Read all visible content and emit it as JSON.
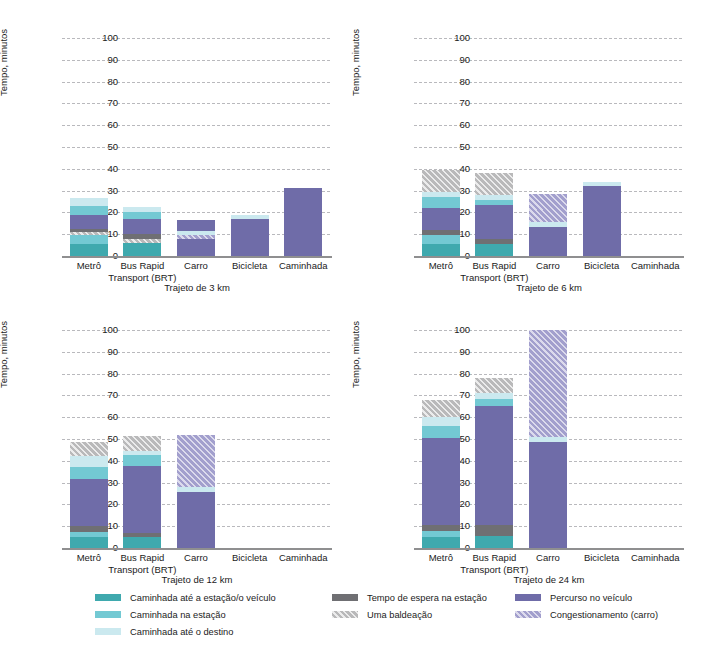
{
  "figure": {
    "ylabel": "Tempo, minutos",
    "yticks": [
      0,
      10,
      20,
      30,
      40,
      50,
      60,
      70,
      80,
      90,
      100
    ],
    "categories": [
      "Metrô",
      "Bus Rapid Transport (BRT)",
      "Carro",
      "Bicicleta",
      "Caminhada"
    ]
  },
  "legend": {
    "columns": [
      {
        "items": [
          {
            "label": "Caminhada até a estação/o veículo",
            "color": "#3fa9ae",
            "key": "walk_station"
          },
          {
            "label": "Caminhada na estação",
            "color": "#73c9d3",
            "key": "walk_in_station"
          },
          {
            "label": "Caminhada até o destino",
            "color": "#cbe9ef",
            "key": "walk_dest"
          }
        ]
      },
      {
        "items": [
          {
            "label": "Tempo de espera na estação",
            "color": "#6f6f73",
            "key": "wait"
          },
          {
            "label": "Uma baldeação",
            "color": "#b9b9ba",
            "key": "transfer"
          }
        ]
      },
      {
        "items": [
          {
            "label": "Percurso no veículo",
            "color": "#6f6ca8",
            "key": "vehicle"
          },
          {
            "label": "Congestionamento (carro)",
            "color": "#a29fcd",
            "key": "congestion"
          }
        ]
      }
    ]
  },
  "chart_data": {
    "type": "bar",
    "stacked": true,
    "title": "",
    "xlabel": "",
    "ylabel": "Tempo, minutos",
    "ylim": [
      0,
      100
    ],
    "yticks": [
      0,
      10,
      20,
      30,
      40,
      50,
      60,
      70,
      80,
      90,
      100
    ],
    "grid": true,
    "legend_position": "bottom",
    "categories": [
      "Metrô",
      "Bus Rapid Transport (BRT)",
      "Carro",
      "Bicicleta",
      "Caminhada"
    ],
    "series": [
      {
        "name": "Caminhada até a estação/o veículo",
        "key": "walk_station",
        "color": "#3fa9ae"
      },
      {
        "name": "Caminhada na estação",
        "key": "walk_in_station",
        "color": "#73c9d3"
      },
      {
        "name": "Tempo de espera na estação",
        "key": "wait",
        "color": "#6f6f73"
      },
      {
        "name": "Percurso no veículo",
        "key": "vehicle",
        "color": "#6f6ca8"
      },
      {
        "name": "Congestionamento (carro)",
        "key": "congestion",
        "color": "#a29fcd"
      },
      {
        "name": "Caminhada até o destino",
        "key": "walk_dest",
        "color": "#cbe9ef"
      },
      {
        "name": "Uma baldeação",
        "key": "transfer",
        "color": "#b9b9ba"
      }
    ],
    "panels": [
      {
        "label": "Trajeto de 3 km",
        "bars": [
          {
            "category": "Metrô",
            "total": 26.5,
            "segments": [
              {
                "key": "walk_station",
                "value": 5.5
              },
              {
                "key": "walk_in_station",
                "value": 4.0
              },
              {
                "key": "transfer",
                "value": 1.5
              },
              {
                "key": "wait",
                "value": 1.5
              },
              {
                "key": "vehicle",
                "value": 6.5
              },
              {
                "key": "walk_in_station",
                "value": 4.0
              },
              {
                "key": "walk_dest",
                "value": 3.5
              }
            ]
          },
          {
            "category": "Bus Rapid Transport (BRT)",
            "total": 22.5,
            "segments": [
              {
                "key": "walk_station",
                "value": 6.0
              },
              {
                "key": "transfer",
                "value": 2.0
              },
              {
                "key": "wait",
                "value": 2.0
              },
              {
                "key": "vehicle",
                "value": 7.0
              },
              {
                "key": "walk_in_station",
                "value": 3.0
              },
              {
                "key": "walk_dest",
                "value": 2.5
              }
            ]
          },
          {
            "category": "Carro",
            "total": 16.5,
            "segments": [
              {
                "key": "vehicle",
                "value": 8.0
              },
              {
                "key": "congestion",
                "value": 1.5
              },
              {
                "key": "walk_dest",
                "value": 2.0
              },
              {
                "key": "vehicle",
                "value": 5.0
              }
            ]
          },
          {
            "category": "Bicicleta",
            "total": 19.0,
            "segments": [
              {
                "key": "vehicle",
                "value": 17.0
              },
              {
                "key": "walk_dest",
                "value": 2.0
              }
            ]
          },
          {
            "category": "Caminhada",
            "total": 31.0,
            "segments": [
              {
                "key": "vehicle",
                "value": 31.0
              }
            ]
          }
        ]
      },
      {
        "label": "Trajeto de 6 km",
        "bars": [
          {
            "category": "Metrô",
            "total": 39.5,
            "segments": [
              {
                "key": "walk_station",
                "value": 5.5
              },
              {
                "key": "walk_in_station",
                "value": 4.0
              },
              {
                "key": "wait",
                "value": 2.5
              },
              {
                "key": "vehicle",
                "value": 10.0
              },
              {
                "key": "walk_in_station",
                "value": 5.0
              },
              {
                "key": "walk_dest",
                "value": 2.5
              },
              {
                "key": "transfer",
                "value": 10.0
              }
            ]
          },
          {
            "category": "Bus Rapid Transport (BRT)",
            "total": 38.0,
            "segments": [
              {
                "key": "walk_station",
                "value": 5.5
              },
              {
                "key": "wait",
                "value": 2.5
              },
              {
                "key": "vehicle",
                "value": 15.5
              },
              {
                "key": "walk_in_station",
                "value": 2.0
              },
              {
                "key": "walk_dest",
                "value": 2.5
              },
              {
                "key": "transfer",
                "value": 10.0
              }
            ]
          },
          {
            "category": "Carro",
            "total": 28.5,
            "segments": [
              {
                "key": "vehicle",
                "value": 13.5
              },
              {
                "key": "walk_dest",
                "value": 2.0
              },
              {
                "key": "congestion",
                "value": 5.5
              },
              {
                "key": "congestion",
                "value": 7.5
              }
            ]
          },
          {
            "category": "Bicicleta",
            "total": 34.0,
            "segments": [
              {
                "key": "vehicle",
                "value": 32.0
              },
              {
                "key": "walk_dest",
                "value": 2.0
              }
            ]
          },
          {
            "category": "Caminhada",
            "total": 0,
            "segments": []
          }
        ]
      },
      {
        "label": "Trajeto de 12 km",
        "bars": [
          {
            "category": "Metrô",
            "total": 48.5,
            "segments": [
              {
                "key": "walk_station",
                "value": 5.0
              },
              {
                "key": "walk_in_station",
                "value": 2.5
              },
              {
                "key": "wait",
                "value": 2.5
              },
              {
                "key": "vehicle",
                "value": 21.5
              },
              {
                "key": "walk_in_station",
                "value": 5.5
              },
              {
                "key": "walk_dest",
                "value": 5.0
              },
              {
                "key": "transfer",
                "value": 6.5
              }
            ]
          },
          {
            "category": "Bus Rapid Transport (BRT)",
            "total": 51.5,
            "segments": [
              {
                "key": "walk_station",
                "value": 5.0
              },
              {
                "key": "wait",
                "value": 2.0
              },
              {
                "key": "vehicle",
                "value": 30.5
              },
              {
                "key": "walk_in_station",
                "value": 5.0
              },
              {
                "key": "walk_dest",
                "value": 2.0
              },
              {
                "key": "transfer",
                "value": 7.0
              }
            ]
          },
          {
            "category": "Carro",
            "total": 52.0,
            "segments": [
              {
                "key": "vehicle",
                "value": 25.5
              },
              {
                "key": "walk_dest",
                "value": 2.5
              },
              {
                "key": "congestion",
                "value": 24.0
              }
            ]
          },
          {
            "category": "Bicicleta",
            "total": 0,
            "segments": []
          },
          {
            "category": "Caminhada",
            "total": 0,
            "segments": []
          }
        ]
      },
      {
        "label": "Trajeto de 24 km",
        "bars": [
          {
            "category": "Metrô",
            "total": 68.0,
            "segments": [
              {
                "key": "walk_station",
                "value": 5.0
              },
              {
                "key": "walk_in_station",
                "value": 3.0
              },
              {
                "key": "wait",
                "value": 2.5
              },
              {
                "key": "vehicle",
                "value": 40.0
              },
              {
                "key": "walk_in_station",
                "value": 5.5
              },
              {
                "key": "walk_dest",
                "value": 4.0
              },
              {
                "key": "transfer",
                "value": 8.0
              }
            ]
          },
          {
            "category": "Bus Rapid Transport (BRT)",
            "total": 78.0,
            "segments": [
              {
                "key": "walk_station",
                "value": 5.5
              },
              {
                "key": "wait",
                "value": 5.0
              },
              {
                "key": "vehicle",
                "value": 54.5
              },
              {
                "key": "walk_in_station",
                "value": 3.5
              },
              {
                "key": "walk_dest",
                "value": 2.5
              },
              {
                "key": "transfer",
                "value": 7.0
              }
            ]
          },
          {
            "category": "Carro",
            "total": 100.0,
            "segments": [
              {
                "key": "vehicle",
                "value": 48.5
              },
              {
                "key": "walk_dest",
                "value": 2.5
              },
              {
                "key": "congestion",
                "value": 49.0
              }
            ]
          },
          {
            "category": "Bicicleta",
            "total": 0,
            "segments": []
          },
          {
            "category": "Caminhada",
            "total": 0,
            "segments": []
          }
        ]
      }
    ]
  }
}
